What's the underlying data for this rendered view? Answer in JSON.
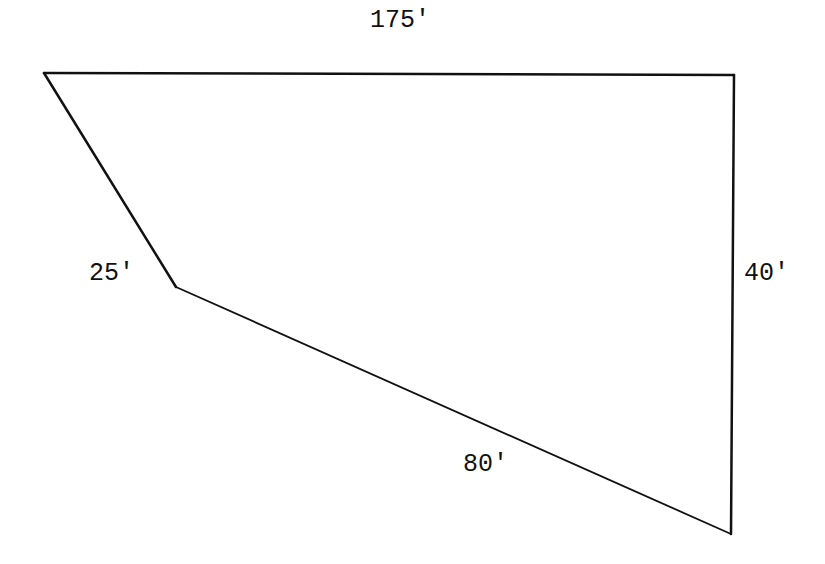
{
  "diagram": {
    "type": "quadrilateral",
    "units": "feet",
    "stroke_color": "#111111",
    "background_color": "#ffffff",
    "vertices": [
      {
        "id": "A",
        "x": 44,
        "y": 73
      },
      {
        "id": "B",
        "x": 734,
        "y": 75
      },
      {
        "id": "C",
        "x": 731,
        "y": 534
      },
      {
        "id": "D",
        "x": 176,
        "y": 287
      }
    ],
    "sides": [
      {
        "id": "top",
        "from": "A",
        "to": "B",
        "label": "175'"
      },
      {
        "id": "right",
        "from": "B",
        "to": "C",
        "label": "40'"
      },
      {
        "id": "bottom",
        "from": "C",
        "to": "D",
        "label": "80'"
      },
      {
        "id": "left",
        "from": "D",
        "to": "A",
        "label": "25'"
      }
    ]
  }
}
